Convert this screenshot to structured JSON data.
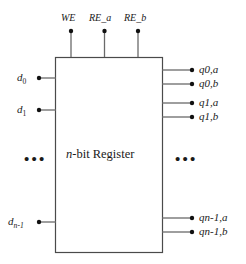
{
  "diagram": {
    "block": {
      "label_italic": "n",
      "label_rest": "-bit Register",
      "stroke": "#3a3a3a",
      "fill": "#ffffff"
    },
    "control_inputs": [
      {
        "name": "we",
        "label": "WE"
      },
      {
        "name": "re-a",
        "label": "RE_a"
      },
      {
        "name": "re-b",
        "label": "RE_b"
      }
    ],
    "data_inputs": [
      {
        "name": "d0",
        "base": "d",
        "sub": "0"
      },
      {
        "name": "d1",
        "base": "d",
        "sub": "1"
      },
      {
        "name": "dn1",
        "base": "d",
        "sub": "n-1"
      }
    ],
    "data_outputs": [
      {
        "name": "q0a",
        "base": "q",
        "sub": "0,a"
      },
      {
        "name": "q0b",
        "base": "q",
        "sub": "0,b"
      },
      {
        "name": "q1a",
        "base": "q",
        "sub": "1,a"
      },
      {
        "name": "q1b",
        "base": "q",
        "sub": "1,b"
      },
      {
        "name": "qn1a",
        "base": "q",
        "sub": "n-1,a"
      },
      {
        "name": "qn1b",
        "base": "q",
        "sub": "n-1,b"
      }
    ],
    "ellipsis": {
      "left": "•••",
      "right": "•••"
    },
    "colors": {
      "line": "#555555",
      "dot": "#111111",
      "text": "#1a1a1a",
      "background": "#ffffff"
    }
  }
}
